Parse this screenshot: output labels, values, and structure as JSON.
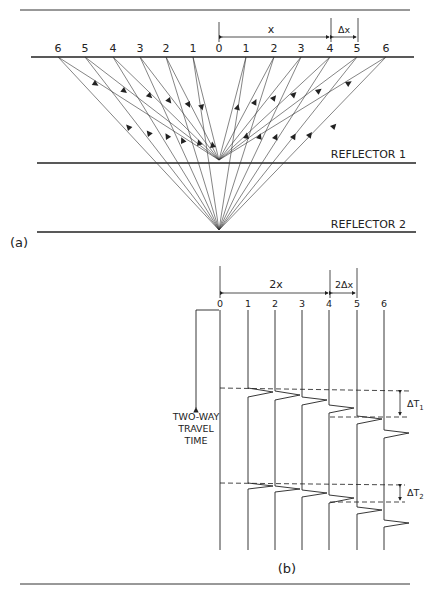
{
  "figure": {
    "panel_a": {
      "caption": "(a)",
      "source_labels_left": [
        "6",
        "5",
        "4",
        "3",
        "2",
        "1"
      ],
      "center_label": "0",
      "receiver_labels_right": [
        "1",
        "2",
        "3",
        "4",
        "5",
        "6"
      ],
      "dimension_x": "x",
      "dimension_dx": "Δx",
      "reflector_1": "REFLECTOR 1",
      "reflector_2": "REFLECTOR 2"
    },
    "panel_b": {
      "caption": "(b)",
      "trace_labels": [
        "0",
        "1",
        "2",
        "3",
        "4",
        "5",
        "6"
      ],
      "dimension_2x": "2x",
      "dimension_2dx": "2Δx",
      "axis_label": [
        "TWO-WAY",
        "TRAVEL",
        "TIME"
      ],
      "delta_t1": "ΔT",
      "delta_t1_sub": "1",
      "delta_t2": "ΔT",
      "delta_t2_sub": "2"
    }
  },
  "colors": {
    "ink": "#222222",
    "background": "#ffffff"
  }
}
